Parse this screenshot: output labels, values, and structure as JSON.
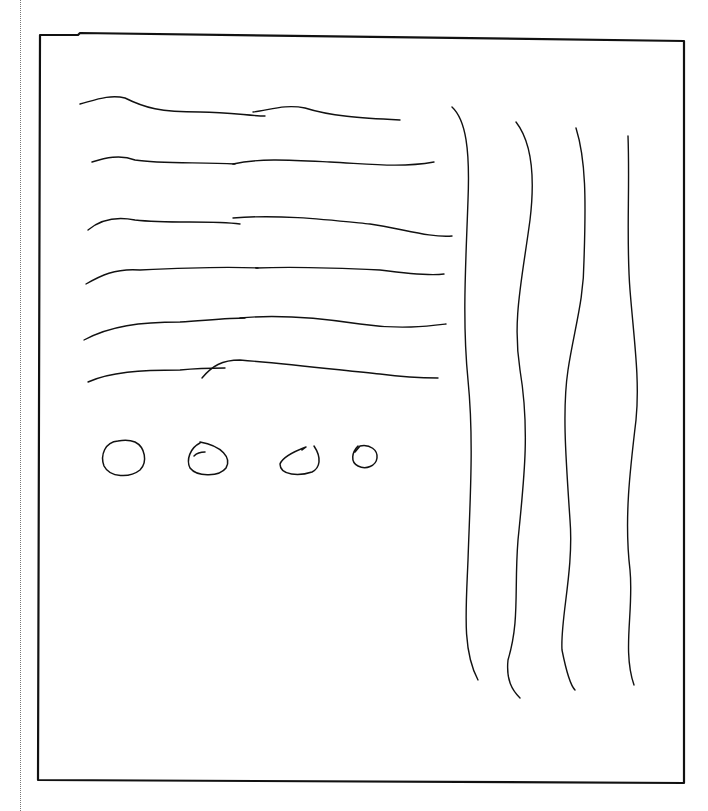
{
  "sketch": {
    "description": "Hand-drawn wireframe sketch",
    "frame": {
      "kind": "rectangle"
    },
    "left_text_lines": {
      "count": 6
    },
    "right_column_lines": {
      "count": 4
    },
    "circles": {
      "count": 4
    },
    "stroke_color": "#111111",
    "background_color": "#ffffff"
  }
}
